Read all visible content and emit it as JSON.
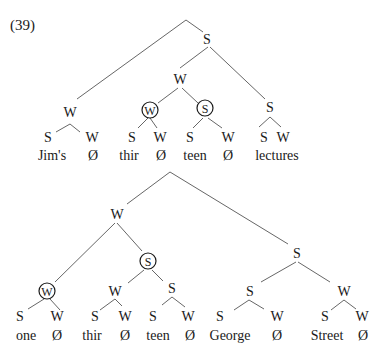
{
  "example_number": "(39)",
  "tree1": {
    "nodes": {
      "root": "S",
      "jims_w": "W",
      "mid_w": "W",
      "thir_w": "W",
      "teen_s": "S",
      "lectures_s": "S",
      "jims_leaf_s": "S",
      "jims_leaf_w": "W",
      "thir_leaf_s": "S",
      "thir_leaf_w": "W",
      "teen_leaf_s": "S",
      "teen_leaf_w": "W",
      "lectures_leaf_s": "S",
      "lectures_leaf_w": "W"
    },
    "words": {
      "jims": "Jim's",
      "jims_null": "Ø",
      "thir": "thir",
      "thir_null": "Ø",
      "teen": "teen",
      "teen_null": "Ø",
      "lectures": "lectures"
    },
    "circled": [
      "thir_w",
      "teen_s"
    ]
  },
  "tree2": {
    "nodes": {
      "top_w": "W",
      "one_w": "W",
      "thirteen_s": "S",
      "thir_w": "W",
      "teen_s": "S",
      "right_s": "S",
      "george_s": "S",
      "street_w": "W",
      "one_leaf_s": "S",
      "one_leaf_w": "W",
      "thir_leaf_s": "S",
      "thir_leaf_w": "W",
      "teen_leaf_s": "S",
      "teen_leaf_w": "W",
      "george_leaf_s": "S",
      "george_leaf_w": "W",
      "street_leaf_s": "S",
      "street_leaf_w": "W"
    },
    "words": {
      "one": "one",
      "one_null": "Ø",
      "thir": "thir",
      "thir_null": "Ø",
      "teen": "teen",
      "teen_null": "Ø",
      "george": "George",
      "george_null": "Ø",
      "street": "Street",
      "street_null": "Ø"
    },
    "circled": [
      "one_w",
      "thirteen_s"
    ]
  }
}
